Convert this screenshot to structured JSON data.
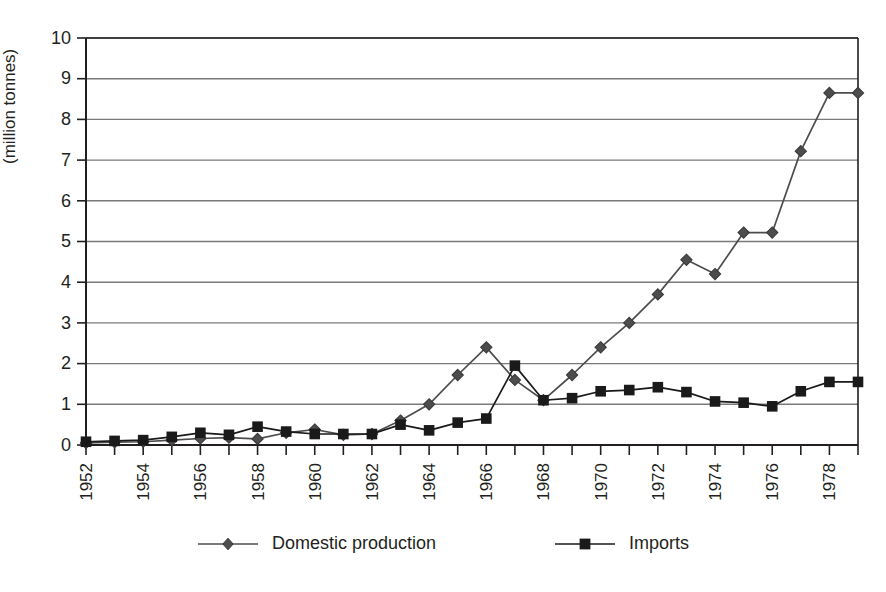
{
  "figure": {
    "title_fragment": "",
    "background": "#ffffff",
    "axis_color": "#231f20",
    "grid_color": "#7a7a7a",
    "series_color": "#4d4d4d",
    "imports_color": "#1a1a1a"
  },
  "axes": {
    "ylabel": "(million tonnes)",
    "ytick_labels": [
      "0",
      "1",
      "2",
      "3",
      "4",
      "5",
      "6",
      "7",
      "8",
      "9",
      "10"
    ],
    "xtick_labels": [
      "1952",
      "1954",
      "1956",
      "1958",
      "1960",
      "1962",
      "1964",
      "1966",
      "1968",
      "1970",
      "1972",
      "1974",
      "1976",
      "1978"
    ]
  },
  "legend": {
    "position": "bottom-center",
    "entries": [
      {
        "label": "Domestic production",
        "marker": "diamond-marker",
        "color": "#4d4d4d"
      },
      {
        "label": "Imports",
        "marker": "square-marker",
        "color": "#1a1a1a"
      }
    ]
  },
  "chart_data": {
    "type": "line",
    "title": "",
    "subtitle": "",
    "xlabel": "",
    "ylabel": "(million tonnes)",
    "xlim": [
      1952,
      1979
    ],
    "ylim": [
      0,
      10
    ],
    "grid": true,
    "grid_axis": "y",
    "legend_position": "bottom-center",
    "x": [
      1952,
      1953,
      1954,
      1955,
      1956,
      1957,
      1958,
      1959,
      1960,
      1961,
      1962,
      1963,
      1964,
      1965,
      1966,
      1967,
      1968,
      1969,
      1970,
      1971,
      1972,
      1973,
      1974,
      1975,
      1976,
      1977,
      1978,
      1979
    ],
    "series": [
      {
        "name": "Domestic production",
        "marker": "diamond",
        "color": "#4d4d4d",
        "values": [
          0.05,
          0.07,
          0.08,
          0.12,
          0.16,
          0.18,
          0.15,
          0.3,
          0.38,
          0.25,
          0.27,
          0.6,
          1.0,
          1.72,
          2.4,
          1.6,
          1.1,
          1.72,
          2.4,
          3.0,
          3.7,
          4.55,
          4.2,
          5.22,
          5.22,
          7.22,
          8.65,
          8.65
        ]
      },
      {
        "name": "Imports",
        "marker": "square",
        "color": "#1a1a1a",
        "values": [
          0.08,
          0.1,
          0.12,
          0.2,
          0.3,
          0.25,
          0.45,
          0.33,
          0.27,
          0.27,
          0.27,
          0.5,
          0.36,
          0.55,
          0.65,
          1.95,
          1.1,
          1.15,
          1.32,
          1.35,
          1.42,
          1.3,
          1.07,
          1.04,
          0.95,
          1.32,
          1.55,
          1.55
        ]
      }
    ]
  }
}
